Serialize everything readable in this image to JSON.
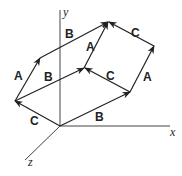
{
  "diagram": {
    "axes": {
      "x": "x",
      "y": "y",
      "z": "z"
    },
    "vectors": [
      {
        "id": "c-origin",
        "label": "C"
      },
      {
        "id": "a-left",
        "label": "A"
      },
      {
        "id": "b-top",
        "label": "B"
      },
      {
        "id": "b-middle",
        "label": "B"
      },
      {
        "id": "a-middle",
        "label": "A"
      },
      {
        "id": "b-bottom",
        "label": "B"
      },
      {
        "id": "c-middle",
        "label": "C"
      },
      {
        "id": "a-right",
        "label": "A"
      },
      {
        "id": "c-top",
        "label": "C"
      }
    ],
    "line_color": "#333333"
  }
}
